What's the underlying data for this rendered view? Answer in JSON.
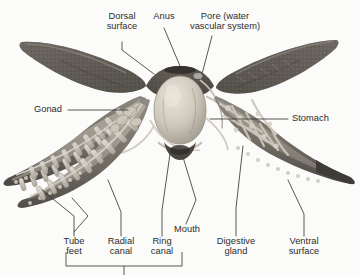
{
  "figure": {
    "style": "grayscale halftone photograph-style illustration",
    "background_color": "#fbfbfa",
    "ink_color": "#2c2c2c",
    "body_dark_color": "#5d5a55",
    "body_mid_color": "#8e8a83",
    "body_light_color": "#c9c4bb",
    "organ_pale_color": "#d8d3c9"
  },
  "labels": [
    {
      "id": "dorsal-surface",
      "text": "Dorsal\nsurface",
      "line1": "Dorsal",
      "line2": "surface"
    },
    {
      "id": "anus",
      "text": "Anus",
      "line1": "Anus",
      "line2": ""
    },
    {
      "id": "pore",
      "text": "Pore (water\nvascular system)",
      "line1": "Pore (water",
      "line2": "vascular system)"
    },
    {
      "id": "gonad",
      "text": "Gonad",
      "line1": "Gonad",
      "line2": ""
    },
    {
      "id": "stomach",
      "text": "Stomach",
      "line1": "Stomach",
      "line2": ""
    },
    {
      "id": "mouth",
      "text": "Mouth",
      "line1": "Mouth",
      "line2": ""
    },
    {
      "id": "tube-feet",
      "text": "Tube\nfeet",
      "line1": "Tube",
      "line2": "feet"
    },
    {
      "id": "radial-canal",
      "text": "Radial\ncanal",
      "line1": "Radial",
      "line2": "canal"
    },
    {
      "id": "ring-canal",
      "text": "Ring\ncanal",
      "line1": "Ring",
      "line2": "canal"
    },
    {
      "id": "digestive-gland",
      "text": "Digestive\ngland",
      "line1": "Digestive",
      "line2": "gland"
    },
    {
      "id": "ventral-surface",
      "text": "Ventral\nsurface",
      "line1": "Ventral",
      "line2": "surface"
    }
  ],
  "grouping_bracket": {
    "present": true,
    "spans": [
      "tube-feet",
      "radial-canal",
      "ring-canal"
    ],
    "caption": "",
    "note": "bracket stem runs off the bottom edge of the image; its caption is not visible"
  }
}
